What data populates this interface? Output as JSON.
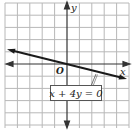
{
  "graph": {
    "x_axis_label": "x",
    "y_axis_label": "y",
    "origin_label": "O",
    "equation_label": "x + 4y = 0",
    "grid": {
      "columns": 10,
      "rows": 10,
      "line_color": "#b5b5b5"
    },
    "line": {
      "equation": "x + 4y = 0",
      "slope": -0.25,
      "intercept": 0,
      "color": "#222222"
    }
  }
}
